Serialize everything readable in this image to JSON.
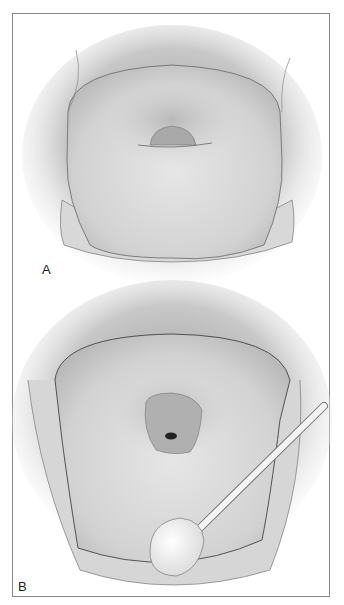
{
  "figure": {
    "panels": [
      {
        "label": "A",
        "description": "Cervix view, smooth os"
      },
      {
        "label": "B",
        "description": "Cervix with swab applicator"
      }
    ]
  }
}
